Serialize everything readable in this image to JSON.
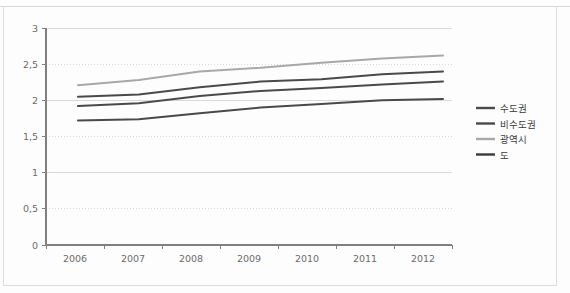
{
  "chart_data": {
    "type": "line",
    "title": "",
    "xlabel": "",
    "ylabel": "",
    "categories": [
      "2006",
      "2007",
      "2008",
      "2009",
      "2010",
      "2011",
      "2012"
    ],
    "x": [
      2006,
      2007,
      2008,
      2009,
      2010,
      2011,
      2012
    ],
    "ylim": [
      0,
      3
    ],
    "y_ticks": [
      0,
      0.5,
      1,
      1.5,
      2,
      2.5,
      3
    ],
    "y_tick_labels": [
      "0",
      "0,5",
      "1",
      "1,5",
      "2",
      "2,5",
      "3"
    ],
    "x_tick_labels": [
      "2006",
      "2007",
      "2008",
      "2009",
      "2010",
      "2011",
      "2012"
    ],
    "grid": true,
    "grid_axis": "y",
    "legend_position": "right",
    "series": [
      {
        "name": "수도권",
        "color": "#4a4a4a",
        "values": [
          2.05,
          2.08,
          2.18,
          2.26,
          2.29,
          2.36,
          2.4
        ]
      },
      {
        "name": "비수도권",
        "color": "#4a4a4a",
        "values": [
          1.92,
          1.96,
          2.06,
          2.13,
          2.17,
          2.22,
          2.26
        ]
      },
      {
        "name": "광역시",
        "color": "#a8a8a8",
        "values": [
          2.21,
          2.28,
          2.4,
          2.45,
          2.52,
          2.58,
          2.62
        ]
      },
      {
        "name": "도",
        "color": "#4a4a4a",
        "values": [
          1.72,
          1.74,
          1.82,
          1.9,
          1.95,
          2.0,
          2.02
        ]
      }
    ]
  },
  "legend": {
    "items": [
      {
        "label": "수도권",
        "color": "#4a4a4a"
      },
      {
        "label": "비수도권",
        "color": "#4a4a4a"
      },
      {
        "label": "광역시",
        "color": "#a8a8a8"
      },
      {
        "label": "도",
        "color": "#3a3a3a"
      }
    ]
  },
  "axes": {
    "axis_color": "#808080",
    "grid_color": "#cfcfcf",
    "tick_text_color": "#6b6b6b"
  },
  "plot_geometry": {
    "left": 46,
    "right": 452,
    "top": 28,
    "bottom": 245,
    "series_x_start": 78,
    "series_x_end": 443
  }
}
